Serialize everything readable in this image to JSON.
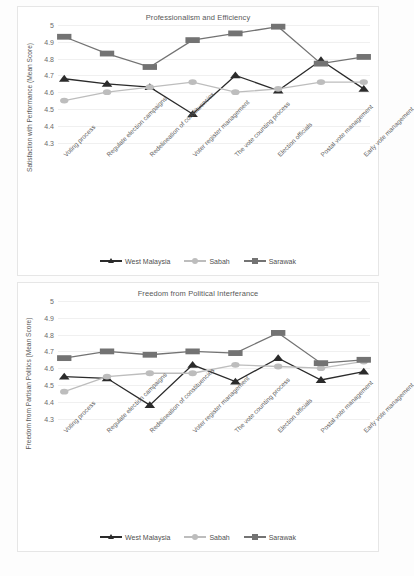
{
  "page": {
    "background": "#fdfdfd"
  },
  "series_colors": {
    "west_malaysia": "#2b2b2b",
    "sabah": "#bdbdbd",
    "sarawak": "#737373"
  },
  "legend": {
    "position": "bottom",
    "entries": [
      {
        "label": "West Malaysia",
        "color": "#2b2b2b",
        "marker": "triangle"
      },
      {
        "label": "Sabah",
        "color": "#bdbdbd",
        "marker": "circle"
      },
      {
        "label": "Sarawak",
        "color": "#737373",
        "marker": "square"
      }
    ]
  },
  "chart_data": [
    {
      "type": "line",
      "title": "Professionalism and Efficiency",
      "xlabel": "",
      "ylabel": "Satisfaction with Performance (Mean Score)",
      "ylim": [
        4.25,
        5.0
      ],
      "yticks": [
        "5",
        "4.9",
        "4.8",
        "4.7",
        "4.6",
        "4.5",
        "4.4",
        "4.3"
      ],
      "ytick_values": [
        5,
        4.9,
        4.8,
        4.7,
        4.6,
        4.5,
        4.4,
        4.3
      ],
      "grid": true,
      "categories": [
        "Voting process",
        "Regulate election campaigns",
        "Redelineation of constituencies",
        "Voter register management",
        "The vote counting process",
        "Election officials",
        "Postal vote management",
        "Early vote management"
      ],
      "series": [
        {
          "name": "West Malaysia",
          "marker": "triangle",
          "color": "#2b2b2b",
          "values": [
            4.68,
            4.65,
            4.63,
            4.47,
            4.7,
            4.61,
            4.79,
            4.62,
            4.65
          ]
        },
        {
          "name": "Sabah",
          "marker": "circle",
          "color": "#bdbdbd",
          "values": [
            4.55,
            4.6,
            4.63,
            4.66,
            4.6,
            4.62,
            4.66,
            4.66
          ]
        },
        {
          "name": "Sarawak",
          "marker": "square",
          "color": "#737373",
          "values": [
            4.93,
            4.83,
            4.75,
            4.91,
            4.95,
            4.99,
            4.77,
            4.81
          ]
        }
      ]
    },
    {
      "type": "line",
      "title": "Freedom from Political Interferance",
      "xlabel": "",
      "ylabel": "Freedom from Partisan Politics (Mean Score)",
      "ylim": [
        4.25,
        5.0
      ],
      "yticks": [
        "5",
        "4.9",
        "4.8",
        "4.7",
        "4.6",
        "4.5",
        "4.4",
        "4.3"
      ],
      "ytick_values": [
        5,
        4.9,
        4.8,
        4.7,
        4.6,
        4.5,
        4.4,
        4.3
      ],
      "grid": true,
      "categories": [
        "Voting process",
        "Regulate election campaigns",
        "Redelineation of constituencies",
        "Voter register management",
        "The vote counting process",
        "Election officials",
        "Postal vote management",
        "Early vote management"
      ],
      "series": [
        {
          "name": "West Malaysia",
          "marker": "triangle",
          "color": "#2b2b2b",
          "values": [
            4.55,
            4.54,
            4.38,
            4.62,
            4.52,
            4.66,
            4.53,
            4.58
          ]
        },
        {
          "name": "Sabah",
          "marker": "circle",
          "color": "#bdbdbd",
          "values": [
            4.46,
            4.55,
            4.57,
            4.57,
            4.62,
            4.61,
            4.6,
            4.64
          ]
        },
        {
          "name": "Sarawak",
          "marker": "square",
          "color": "#737373",
          "values": [
            4.66,
            4.7,
            4.68,
            4.7,
            4.69,
            4.81,
            4.63,
            4.65
          ]
        }
      ]
    }
  ]
}
